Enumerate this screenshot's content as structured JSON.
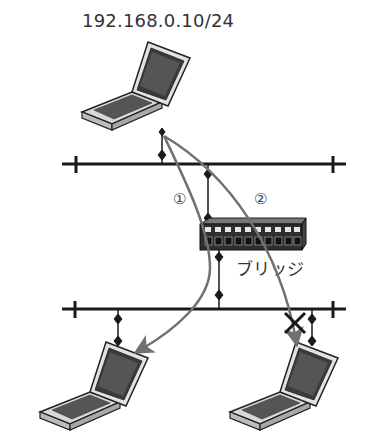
{
  "diagram": {
    "source_host_label": "192.168.0.10/24",
    "bridge_label": "ブリッジ",
    "paths": [
      {
        "id": "1",
        "label": "①",
        "status": "delivered"
      },
      {
        "id": "2",
        "label": "②",
        "status": "blocked"
      }
    ],
    "colors": {
      "line": "#1a1a1a",
      "arrow": "#707070",
      "laptop_body": "#cfcfcf",
      "laptop_screen": "#3a3a3a",
      "bridge_body": "#2e2e2e",
      "bridge_port": "#e8e8e8"
    }
  }
}
